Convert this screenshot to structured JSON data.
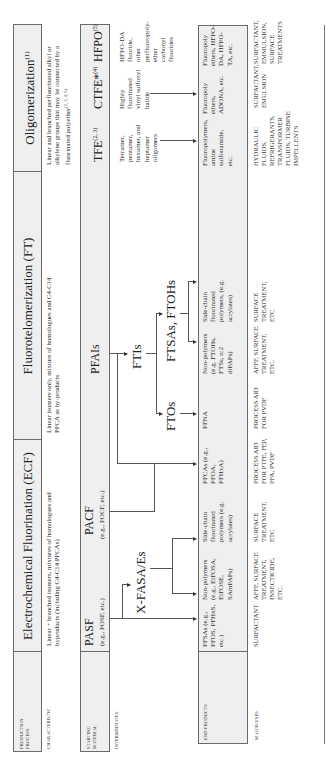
{
  "row_labels": {
    "production_process": "Production process",
    "characteristic": "Characteristic",
    "starting_material": "Starting material",
    "intermediates": "Intermediates",
    "end_products": "End products",
    "major_uses": "Major uses"
  },
  "processes": [
    {
      "title": "Electrochemical Fluorination (ECF)",
      "characteristic": "Linear + branched isomers, mixtures of homologues and byproducts (including C4-C14 PFCAs)"
    },
    {
      "title": "Fluorotelomerization (FT)",
      "characteristic": "Linear isomers only, mixture of homologues and C4-C14 PFCA as by-products"
    },
    {
      "title": "Oligomerization",
      "title_sup": "(1)",
      "characteristic": "Linear and branched perfluorinated alkyl or alkylene groups that may be connected by a fluorinated polyether",
      "characteristic_sup": "(2, 3, 4, 5)"
    }
  ],
  "starting_materials": [
    {
      "name": "PASF",
      "example": "(e.g., POSF, etc.)"
    },
    {
      "name": "PACF",
      "example": "(e.g., POCF, etc.)"
    },
    {
      "name": "PFAIs",
      "example": ""
    },
    {
      "name": "TFE",
      "sup": "(2, 3)"
    },
    {
      "name": "CTFE*",
      "sup": "(4)"
    },
    {
      "name": "HFPO",
      "sup": "(5)"
    }
  ],
  "intermediates": {
    "xfasa": "X-FASA/Es",
    "ftis": "FTIs",
    "ftos": "FTOs",
    "ftsas": "FTSAs, FTOHs",
    "tfe_desc": "Tetramer, pentamer, hexamer, and heptamer oligomers",
    "ctfe_desc": "Highly fluorinated vinyl sulfonyl halide",
    "hfpo_desc": "HFPO-DA fluoride, other perfluoropoly-ether carbonyl fluorides"
  },
  "end_products": [
    "PFSAs (e.g., PFOS, PFHxS, etc.)",
    "Non-polymers (e.g., EtFOSA, EtFOSE, SAmPAPs)",
    "Side-chain fluorinated polymers (e.g. acrylates)",
    "PFCAs (e.g., PFOA, PFHxA)",
    "PFNA",
    "Non-polymers (e.g. FTOHs, FTSs, n:2 diPAPs)",
    "Side-chain fluorinated polymers, (e.g. acrylates)",
    "Fluoropolymers, amine sulfonamide, etc.",
    "Fluoropoly ethers, ADONA, etc.",
    "Fluoropoly ethers, HFPO-DA, HFPO-TA, etc."
  ],
  "major_uses": [
    "Surfactant",
    "AFFF, surface treatment, insecticide, etc.",
    "Surface treatment, etc",
    "Process aid for PTFE, FEP, PFA, PVDF",
    "Process aid for PVDF",
    "AFFF, surface treatment, etc.",
    "Surface treatment, etc",
    "Hydraulic fluids, refrigerants, transformer fluids, turbine impellents",
    "Surfactant, emulsion",
    "Surfactant, emmulsion, surface treatments"
  ]
}
